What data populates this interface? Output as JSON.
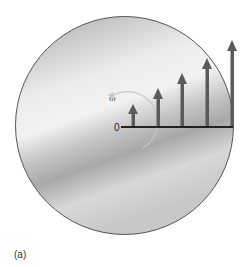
{
  "figure": {
    "caption": "(a)",
    "origin_label": "0",
    "angular_velocity_label": "ω",
    "disk": {
      "cx": 124.5,
      "cy": 125.5,
      "r": 109,
      "stroke": "#555555"
    },
    "axis": {
      "x1": 121,
      "x2": 233,
      "y": 127,
      "color": "#222222"
    },
    "arrow_color": "#5a5a5a",
    "arrows": [
      {
        "x": 133,
        "tip_y": 104
      },
      {
        "x": 158,
        "tip_y": 88
      },
      {
        "x": 182,
        "tip_y": 73
      },
      {
        "x": 207,
        "tip_y": 58
      },
      {
        "x": 232,
        "tip_y": 40
      }
    ]
  }
}
